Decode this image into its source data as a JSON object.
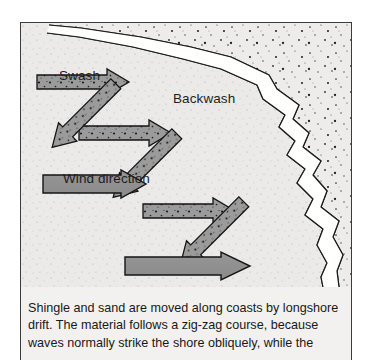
{
  "figure": {
    "kind": "longshore-drift-diagram",
    "labels": {
      "swash": "Swash",
      "backwash": "Backwash",
      "wind_direction": "Wind direction"
    },
    "caption_lines": [
      "Shingle and sand are moved along coasts by longshore",
      "drift. The material follows a zig-zag course, because",
      "waves normally strike the shore obliquely, while the"
    ],
    "colors": {
      "page_background": "#ffffff",
      "panel_background": "#eeedeb",
      "sea_stipple": "#2b2b2b",
      "beach_fill": "#e9e8e6",
      "arrow_fill": "#8e8e8e",
      "arrow_stipple_fill": "#9a9a9a",
      "arrow_outline": "#1a1a1a",
      "shoreline_stroke": "#1a1a1a",
      "frame_border": "#3b3b3b",
      "text": "#1d1d1d"
    },
    "arrows": {
      "swash_count": 4,
      "backwash_count": 4,
      "wind_count": 2,
      "stippled": true
    }
  }
}
